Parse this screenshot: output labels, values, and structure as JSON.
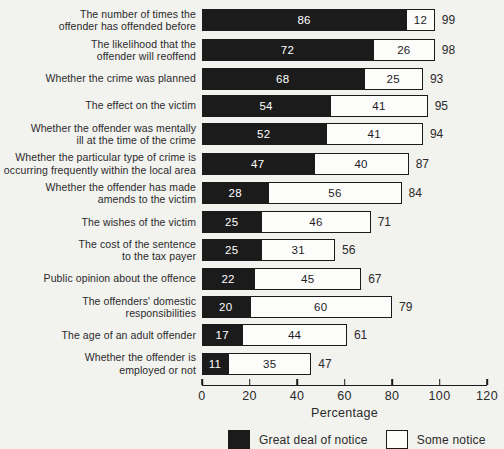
{
  "colors": {
    "background": "#f2f2ef",
    "ink": "#1b1b1b",
    "bar_black_fill": "#1b1b1b",
    "bar_white_fill": "#fcfcfb"
  },
  "chart_data": {
    "type": "bar",
    "orientation": "horizontal",
    "stacked": true,
    "title": "",
    "xlabel": "Percentage",
    "xlim": [
      0,
      120
    ],
    "xticks": [
      0,
      20,
      40,
      60,
      80,
      100,
      120
    ],
    "grid": false,
    "legend_position": "bottom",
    "categories": [
      "The number of times the offender has offended before",
      "The likelihood that the offender will reoffend",
      "Whether the crime was planned",
      "The effect on the victim",
      "Whether the offender was mentally ill at the time of the crime",
      "Whether the particular type of crime is occurring frequently within the local area",
      "Whether the offender has made amends to the victim",
      "The wishes of the victim",
      "The cost of the sentence to the tax payer",
      "Public opinion about the offence",
      "The offenders' domestic responsibilities",
      "The age of an adult offender",
      "Whether the offender is employed or not"
    ],
    "label_lines": [
      [
        "The number of times the",
        "offender has offended before"
      ],
      [
        "The likelihood that the",
        "offender will reoffend"
      ],
      [
        "Whether the crime was planned"
      ],
      [
        "The effect on the victim"
      ],
      [
        "Whether the offender was mentally",
        "ill at the time of the crime"
      ],
      [
        "Whether the particular type of crime is",
        "occurring frequently within the local area"
      ],
      [
        "Whether the offender has made",
        "amends to the victim"
      ],
      [
        "The wishes of the victim"
      ],
      [
        "The cost of the sentence",
        "to the tax payer"
      ],
      [
        "Public opinion about the offence"
      ],
      [
        "The offenders' domestic",
        "responsibilities"
      ],
      [
        "The age of an adult offender"
      ],
      [
        "Whether the offender is",
        "employed or not"
      ]
    ],
    "series": [
      {
        "name": "Great deal of notice",
        "fill": "#1b1b1b",
        "text_color": "#ffffff",
        "values": [
          86,
          72,
          68,
          54,
          52,
          47,
          28,
          25,
          25,
          22,
          20,
          17,
          11
        ]
      },
      {
        "name": "Some notice",
        "fill": "#fcfcfb",
        "text_color": "#1b1b1b",
        "values": [
          12,
          26,
          25,
          41,
          41,
          40,
          56,
          46,
          31,
          45,
          60,
          44,
          35
        ]
      }
    ],
    "totals": [
      99,
      98,
      93,
      95,
      94,
      87,
      84,
      71,
      56,
      67,
      79,
      61,
      47
    ]
  }
}
